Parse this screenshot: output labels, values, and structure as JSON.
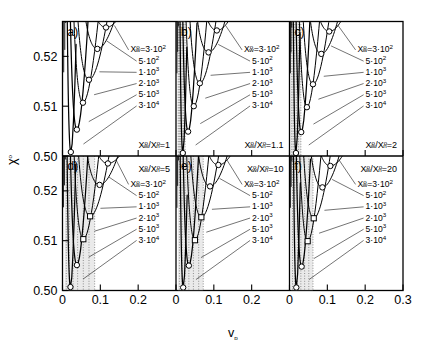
{
  "figure": {
    "type": "multi-panel-line",
    "panel_rows": 2,
    "panel_cols": 3,
    "xlabel": "v",
    "xlabel_sub": "p",
    "ylabel": "χ",
    "ylabel_sup": "o",
    "xlim": [
      0.0,
      0.3
    ],
    "xticks": [
      0,
      0.1,
      0.2,
      0.3
    ],
    "xticklabels": [
      "0",
      "0.1",
      "0.2",
      "0.3"
    ],
    "ylim": [
      0.5,
      0.527
    ],
    "yticks": [
      0.5,
      0.51,
      0.52
    ],
    "yticklabels": [
      "0.50",
      "0.51",
      "0.52"
    ],
    "grid": false,
    "legend_position": "in-panel-annotations"
  },
  "series_legend": {
    "prefix": "X",
    "prefix_sub": "w",
    "prefix_sup": "o",
    "first_entry": "=3·10",
    "first_entry_exp": "2",
    "entries": [
      {
        "label": "5·10",
        "exp": "2",
        "value": 500
      },
      {
        "label": "1·10",
        "exp": "3",
        "value": 1000
      },
      {
        "label": "2·10",
        "exp": "3",
        "value": 2000
      },
      {
        "label": "5·10",
        "exp": "3",
        "value": 5000
      },
      {
        "label": "3·10",
        "exp": "4",
        "value": 30000
      }
    ],
    "all_values": [
      300,
      500,
      1000,
      2000,
      5000,
      30000
    ]
  },
  "chart_data": {
    "type": "line",
    "title": "",
    "xlabel": "v_p",
    "ylabel": "chi_o",
    "xlim": [
      0.0,
      0.3
    ],
    "ylim": [
      0.5,
      0.527
    ],
    "grid": false,
    "panels": [
      {
        "tag": "a)",
        "ratio_label": "=1",
        "ratio_num": 1,
        "shaded": false,
        "dotted": false,
        "series": [
          {
            "name": "3·10^2",
            "min_x": 0.115,
            "min_y": 0.5258,
            "x_left": 0.047,
            "curvature": 1.55
          },
          {
            "name": "5·10^2",
            "min_x": 0.092,
            "min_y": 0.5215,
            "x_left": 0.037,
            "curvature": 1.75
          },
          {
            "name": "1·10^3",
            "min_x": 0.07,
            "min_y": 0.5153,
            "x_left": 0.028,
            "curvature": 2.05
          },
          {
            "name": "2·10^3",
            "min_x": 0.054,
            "min_y": 0.5107,
            "x_left": 0.021,
            "curvature": 2.45
          },
          {
            "name": "5·10^3",
            "min_x": 0.038,
            "min_y": 0.5053,
            "x_left": 0.015,
            "curvature": 3.05
          },
          {
            "name": "3·10^4",
            "min_x": 0.022,
            "min_y": 0.5008,
            "x_left": 0.008,
            "curvature": 4.3
          }
        ]
      },
      {
        "tag": "b)",
        "ratio_label": "=1.1",
        "ratio_num": 1.1,
        "shaded": true,
        "dotted": true,
        "shade_x0": 0.004,
        "shade_x1": 0.024,
        "dotted_x": [
          0.006,
          0.009,
          0.012,
          0.016,
          0.02,
          0.024
        ],
        "series": [
          {
            "name": "3·10^2",
            "min_x": 0.108,
            "min_y": 0.5252,
            "x_left": 0.04,
            "curvature": 1.6
          },
          {
            "name": "5·10^2",
            "min_x": 0.086,
            "min_y": 0.5208,
            "x_left": 0.031,
            "curvature": 1.85
          },
          {
            "name": "1·10^3",
            "min_x": 0.063,
            "min_y": 0.5146,
            "x_left": 0.022,
            "curvature": 2.2
          },
          {
            "name": "2·10^3",
            "min_x": 0.047,
            "min_y": 0.51,
            "x_left": 0.016,
            "curvature": 2.65
          },
          {
            "name": "5·10^3",
            "min_x": 0.032,
            "min_y": 0.5049,
            "x_left": 0.011,
            "curvature": 3.35
          },
          {
            "name": "3·10^4",
            "min_x": 0.018,
            "min_y": 0.5006,
            "x_left": 0.006,
            "curvature": 4.8
          }
        ]
      },
      {
        "tag": "c)",
        "ratio_label": "=2",
        "ratio_num": 2,
        "shaded": true,
        "dotted": true,
        "shade_x0": 0.004,
        "shade_x1": 0.03,
        "dotted_x": [
          0.006,
          0.01,
          0.014,
          0.019,
          0.024,
          0.03
        ],
        "series": [
          {
            "name": "3·10^2",
            "min_x": 0.105,
            "min_y": 0.525,
            "x_left": 0.038,
            "curvature": 1.62
          },
          {
            "name": "5·10^2",
            "min_x": 0.084,
            "min_y": 0.5205,
            "x_left": 0.03,
            "curvature": 1.88
          },
          {
            "name": "1·10^3",
            "min_x": 0.062,
            "min_y": 0.5144,
            "x_left": 0.021,
            "curvature": 2.22
          },
          {
            "name": "2·10^3",
            "min_x": 0.046,
            "min_y": 0.5098,
            "x_left": 0.015,
            "curvature": 2.7
          },
          {
            "name": "5·10^3",
            "min_x": 0.031,
            "min_y": 0.5048,
            "x_left": 0.01,
            "curvature": 3.4
          },
          {
            "name": "3·10^4",
            "min_x": 0.017,
            "min_y": 0.5006,
            "x_left": 0.006,
            "curvature": 4.9
          }
        ]
      },
      {
        "tag": "d)",
        "ratio_label": "=5",
        "ratio_num": 5,
        "shaded": true,
        "dotted": true,
        "shade_x0": 0.006,
        "shade_x1": 0.085,
        "dotted_x": [
          0.01,
          0.018,
          0.028,
          0.04,
          0.055,
          0.07,
          0.085
        ],
        "series": [
          {
            "name": "3·10^2",
            "min_x": 0.12,
            "min_y": 0.5255,
            "x_left": 0.044,
            "curvature": 1.55
          },
          {
            "name": "5·10^2",
            "min_x": 0.098,
            "min_y": 0.5212,
            "x_left": 0.035,
            "curvature": 1.78
          },
          {
            "name": "1·10^3",
            "min_x": 0.073,
            "min_y": 0.5149,
            "x_left": 0.026,
            "curvature": 2.1
          },
          {
            "name": "2·10^3",
            "min_x": 0.055,
            "min_y": 0.5103,
            "x_left": 0.019,
            "curvature": 2.52
          },
          {
            "name": "5·10^3",
            "min_x": 0.038,
            "min_y": 0.5051,
            "x_left": 0.013,
            "curvature": 3.15
          },
          {
            "name": "3·10^4",
            "min_x": 0.021,
            "min_y": 0.5007,
            "x_left": 0.007,
            "curvature": 4.5
          }
        ]
      },
      {
        "tag": "e)",
        "ratio_label": "=10",
        "ratio_num": 10,
        "shaded": true,
        "dotted": true,
        "shade_x0": 0.005,
        "shade_x1": 0.072,
        "dotted_x": [
          0.009,
          0.016,
          0.024,
          0.034,
          0.046,
          0.06,
          0.072
        ],
        "series": [
          {
            "name": "3·10^2",
            "min_x": 0.112,
            "min_y": 0.5252,
            "x_left": 0.041,
            "curvature": 1.58
          },
          {
            "name": "5·10^2",
            "min_x": 0.09,
            "min_y": 0.5209,
            "x_left": 0.032,
            "curvature": 1.82
          },
          {
            "name": "1·10^3",
            "min_x": 0.067,
            "min_y": 0.5147,
            "x_left": 0.023,
            "curvature": 2.15
          },
          {
            "name": "2·10^3",
            "min_x": 0.05,
            "min_y": 0.5101,
            "x_left": 0.017,
            "curvature": 2.6
          },
          {
            "name": "5·10^3",
            "min_x": 0.034,
            "min_y": 0.505,
            "x_left": 0.011,
            "curvature": 3.25
          },
          {
            "name": "3·10^4",
            "min_x": 0.019,
            "min_y": 0.5006,
            "x_left": 0.006,
            "curvature": 4.65
          }
        ]
      },
      {
        "tag": "f)",
        "ratio_label": "=20",
        "ratio_num": 20,
        "shaded": true,
        "dotted": true,
        "shade_x0": 0.004,
        "shade_x1": 0.062,
        "dotted_x": [
          0.008,
          0.014,
          0.021,
          0.03,
          0.04,
          0.051,
          0.062
        ],
        "series": [
          {
            "name": "3·10^2",
            "min_x": 0.108,
            "min_y": 0.525,
            "x_left": 0.039,
            "curvature": 1.6
          },
          {
            "name": "5·10^2",
            "min_x": 0.087,
            "min_y": 0.5207,
            "x_left": 0.031,
            "curvature": 1.85
          },
          {
            "name": "1·10^3",
            "min_x": 0.064,
            "min_y": 0.5145,
            "x_left": 0.022,
            "curvature": 2.18
          },
          {
            "name": "2·10^3",
            "min_x": 0.048,
            "min_y": 0.5099,
            "x_left": 0.016,
            "curvature": 2.65
          },
          {
            "name": "5·10^3",
            "min_x": 0.032,
            "min_y": 0.5048,
            "x_left": 0.011,
            "curvature": 3.32
          },
          {
            "name": "3·10^4",
            "min_x": 0.018,
            "min_y": 0.5006,
            "x_left": 0.006,
            "curvature": 4.75
          }
        ]
      }
    ]
  },
  "colors": {
    "curve": "#000000",
    "axis": "#000000",
    "background": "#ffffff",
    "shade": "#d9d9d9",
    "dotted": "#777777"
  }
}
